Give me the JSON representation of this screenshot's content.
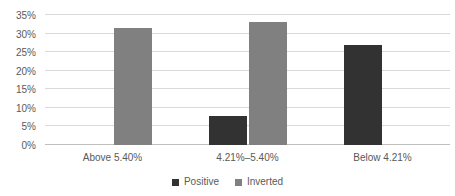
{
  "chart_data": {
    "type": "bar",
    "title": "",
    "subtitle": "",
    "xlabel": "",
    "ylabel": "",
    "categories": [
      "Above 5.40%",
      "4.21%–5.40%",
      "Below 4.21%"
    ],
    "series": [
      {
        "name": "Positive",
        "color": "#323232",
        "values": [
          0,
          7.8,
          27.0
        ]
      },
      {
        "name": "Inverted",
        "color": "#808080",
        "values": [
          31.4,
          33.0,
          0
        ]
      }
    ],
    "ylim": [
      0,
      35
    ],
    "ytick_step": 5,
    "ytick_labels": [
      "0%",
      "5%",
      "10%",
      "15%",
      "20%",
      "25%",
      "30%",
      "35%"
    ],
    "ytick_values": [
      0,
      5,
      10,
      15,
      20,
      25,
      30,
      35
    ],
    "grid": true,
    "grid_axis": "y",
    "legend": true,
    "legend_position": "bottom",
    "legend_entries": [
      "Positive",
      "Inverted"
    ],
    "value_format": "percent",
    "background_color": "#ffffff",
    "grid_color": "#d9d9d9",
    "axis_color": "#bfbfbf",
    "text_color": "#595959"
  }
}
